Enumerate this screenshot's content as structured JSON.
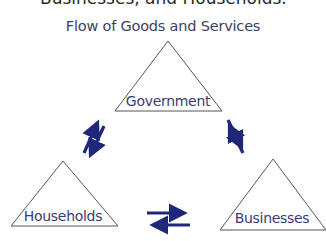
{
  "heading_partial": "Businesses, and Households.",
  "title": "Flow of Goods and Services",
  "nodes": [
    {
      "id": "government",
      "label": "Government"
    },
    {
      "id": "households",
      "label": "Households"
    },
    {
      "id": "businesses",
      "label": "Businesses"
    }
  ],
  "edges": [
    {
      "from": "government",
      "to": "households",
      "type": "bidirectional-arrows"
    },
    {
      "from": "government",
      "to": "businesses",
      "type": "bidirectional-arrows"
    },
    {
      "from": "households",
      "to": "businesses",
      "type": "bidirectional-arrows"
    }
  ],
  "colors": {
    "title": "#3d3f63",
    "labels": "#3a3c75",
    "arrows": "#1f2878",
    "triangle_stroke": "#555555"
  }
}
